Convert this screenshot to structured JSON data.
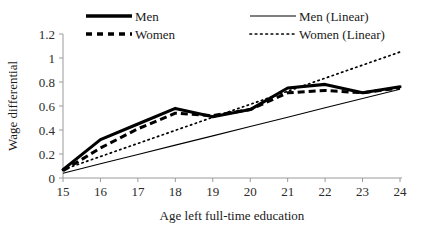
{
  "chart_data": {
    "type": "line",
    "title": "",
    "xlabel": "Age left full-time education",
    "ylabel": "Wage differential",
    "x": [
      15,
      16,
      17,
      18,
      19,
      20,
      21,
      22,
      23,
      24
    ],
    "xtick_labels": [
      "15",
      "16",
      "17",
      "18",
      "19",
      "20",
      "21",
      "22",
      "23",
      "24"
    ],
    "ytick_labels": [
      "0",
      "0.2",
      "0.4",
      "0.6",
      "0.8",
      "1",
      "1.2"
    ],
    "yticks": [
      0,
      0.2,
      0.4,
      0.6,
      0.8,
      1,
      1.2
    ],
    "xlim": [
      15,
      24
    ],
    "ylim": [
      0,
      1.2
    ],
    "grid": false,
    "legend_position": "top",
    "series": [
      {
        "name": "Men",
        "style": "thick-solid",
        "values": [
          0.07,
          0.32,
          0.45,
          0.58,
          0.51,
          0.57,
          0.75,
          0.78,
          0.71,
          0.76
        ]
      },
      {
        "name": "Women",
        "style": "thick-dashed",
        "values": [
          0.06,
          0.25,
          0.41,
          0.54,
          0.52,
          0.57,
          0.71,
          0.73,
          0.71,
          0.75
        ]
      },
      {
        "name": "Men (Linear)",
        "style": "thin-solid",
        "trend": true,
        "values": [
          0.04,
          0.118,
          0.196,
          0.274,
          0.351,
          0.429,
          0.507,
          0.585,
          0.662,
          0.74
        ]
      },
      {
        "name": "Women (Linear)",
        "style": "thin-dotted",
        "trend": true,
        "values": [
          0.07,
          0.179,
          0.288,
          0.397,
          0.506,
          0.614,
          0.723,
          0.832,
          0.941,
          1.05
        ]
      }
    ]
  },
  "legend": {
    "entries": [
      {
        "label": "Men",
        "icon": "thick-solid-line-swatch"
      },
      {
        "label": "Women",
        "icon": "thick-dashed-line-swatch"
      },
      {
        "label": "Men (Linear)",
        "icon": "thin-solid-line-swatch"
      },
      {
        "label": "Women (Linear)",
        "icon": "thin-dotted-line-swatch"
      }
    ]
  },
  "colors": {
    "series": "#000000",
    "axis": "#9a9a9a",
    "background": "#ffffff",
    "text": "#1a1a1a"
  }
}
